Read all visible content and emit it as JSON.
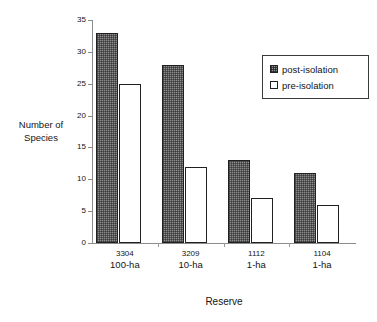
{
  "chart_data": {
    "type": "bar",
    "title": "",
    "xlabel": "Reserve",
    "ylabel": "Number of\nSpecies",
    "ylabel_line1": "Number of",
    "ylabel_line2": "Species",
    "categories": [
      "3304\n100-ha",
      "3209\n10-ha",
      "1112\n1-ha",
      "1104\n1-ha"
    ],
    "category_rows": [
      {
        "code": "3304",
        "size": "100-ha"
      },
      {
        "code": "3209",
        "size": "10-ha"
      },
      {
        "code": "1112",
        "size": "1-ha"
      },
      {
        "code": "1104",
        "size": "1-ha"
      }
    ],
    "series": [
      {
        "name": "post-isolation",
        "values": [
          33,
          28,
          13,
          11
        ],
        "fill": "#8e8e8e",
        "pattern": "checker",
        "border": "#231f20"
      },
      {
        "name": "pre-isolation",
        "values": [
          25,
          12,
          7,
          6
        ],
        "fill": "#ffffff",
        "pattern": "solid",
        "border": "#231f20"
      }
    ],
    "ylim": [
      0,
      35
    ],
    "ytick_values": [
      0,
      5,
      10,
      15,
      20,
      25,
      30,
      35
    ],
    "ytick_labels": [
      "0",
      "5",
      "10",
      "15",
      "20",
      "25",
      "30",
      "35"
    ],
    "grid": false,
    "legend_position": "upper right",
    "legend_entries": [
      "post-isolation",
      "pre-isolation"
    ],
    "axis_color": "#8c8c8c",
    "text_color": "#141414"
  },
  "legend": {
    "items": [
      {
        "label": "post-isolation",
        "style": "post"
      },
      {
        "label": "pre-isolation",
        "style": "pre"
      }
    ]
  }
}
